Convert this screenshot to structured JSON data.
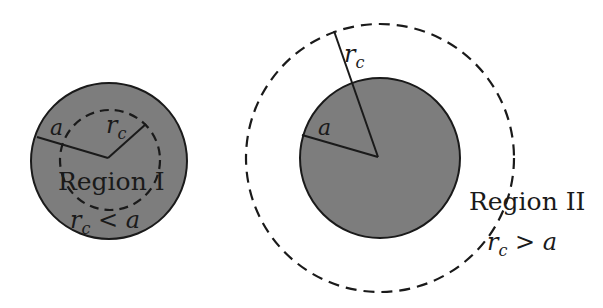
{
  "diagram": {
    "colors": {
      "fill": "#7d7d7d",
      "stroke": "#1a1a1a",
      "background": "#ffffff"
    },
    "region1": {
      "label": "Region I",
      "condition_rc": "r",
      "condition_sub": "c",
      "condition_rest": " < a",
      "radius_a_label": "a",
      "radius_rc_label": "r",
      "radius_rc_sub": "c"
    },
    "region2": {
      "label": "Region II",
      "condition_rc": "r",
      "condition_sub": "c",
      "condition_rest": " > a",
      "radius_a_label": "a",
      "radius_rc_label": "r",
      "radius_rc_sub": "c"
    }
  }
}
